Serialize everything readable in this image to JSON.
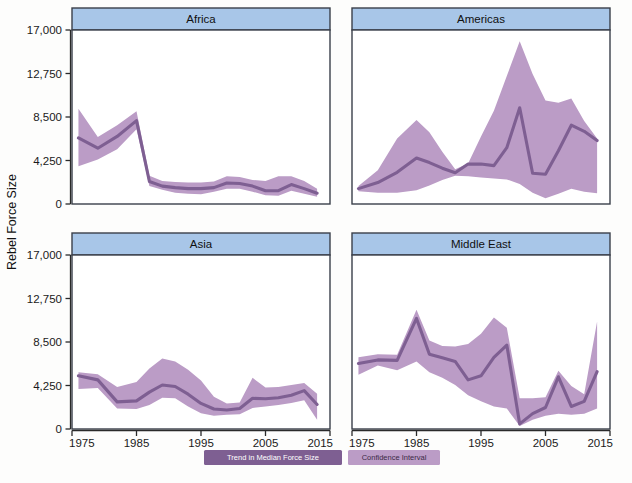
{
  "figure": {
    "ylabel": "Rebel Force Size",
    "panel_header_color": "#a8c6e8",
    "panel_border_color": "#3a3f4a",
    "band_color": "#bb9cc6",
    "line_color": "#7e5f92",
    "background": "#fdfdfc"
  },
  "legend": {
    "items": [
      {
        "label": "Trend in Median Force Size",
        "swatch": "#7e5f92",
        "text_color": "#ffffff"
      },
      {
        "label": "Confidence Interval",
        "swatch": "#bb9cc6",
        "text_color": "#3b2a46"
      }
    ]
  },
  "chart_data": {
    "type": "line",
    "title": "",
    "subtitle": "",
    "xlabel": "",
    "ylabel": "Rebel Force Size",
    "xlim": [
      1975,
      2015
    ],
    "ylim": [
      0,
      17000
    ],
    "xticks": [
      1975,
      1985,
      1995,
      2005,
      2015
    ],
    "xticklabels": [
      "1975",
      "1985",
      "1995",
      "2005",
      "2015"
    ],
    "yticks": [
      0,
      4250,
      8500,
      12750,
      17000
    ],
    "yticklabels": [
      "0",
      "4,250",
      "8,500",
      "12,750",
      "17,000"
    ],
    "grid": false,
    "legend_position": "bottom",
    "facet_layout": [
      [
        "Africa",
        "Americas"
      ],
      [
        "Asia",
        "Middle East"
      ]
    ],
    "band_label": "Confidence Interval",
    "line_label": "Trend in Median Force Size",
    "panels": [
      {
        "name": "Africa",
        "x": [
          1976,
          1979,
          1982,
          1985,
          1987,
          1989,
          1991,
          1993,
          1995,
          1997,
          1999,
          2001,
          2003,
          2005,
          2007,
          2009,
          2011,
          2013
        ],
        "median": [
          6450,
          5450,
          6600,
          8150,
          2200,
          1750,
          1600,
          1500,
          1500,
          1600,
          2050,
          2000,
          1750,
          1300,
          1300,
          1900,
          1500,
          1050
        ],
        "lower": [
          3700,
          4350,
          5350,
          7300,
          1750,
          1400,
          1100,
          1000,
          950,
          1200,
          1500,
          1500,
          1200,
          850,
          800,
          1300,
          1000,
          700
        ],
        "upper": [
          9300,
          6550,
          7700,
          9050,
          2750,
          2250,
          2150,
          2100,
          2100,
          2200,
          2700,
          2650,
          2350,
          2250,
          2700,
          2700,
          2250,
          1500
        ]
      },
      {
        "name": "Americas",
        "x": [
          1976,
          1979,
          1982,
          1985,
          1987,
          1989,
          1991,
          1993,
          1995,
          1997,
          1999,
          2001,
          2003,
          2005,
          2007,
          2009,
          2011,
          2013
        ],
        "median": [
          1500,
          2100,
          3100,
          4500,
          4050,
          3500,
          3050,
          3900,
          3900,
          3750,
          5500,
          9400,
          3000,
          2900,
          5200,
          7700,
          7100,
          6200
        ],
        "lower": [
          1250,
          1100,
          1100,
          1350,
          1800,
          2350,
          2750,
          2700,
          2600,
          2500,
          2400,
          1950,
          1100,
          550,
          1000,
          1500,
          1200,
          1050
        ],
        "upper": [
          1750,
          3300,
          6400,
          8200,
          7000,
          5100,
          3400,
          3950,
          6600,
          9100,
          12500,
          15900,
          12700,
          10100,
          9900,
          10300,
          8100,
          6400
        ]
      },
      {
        "name": "Asia",
        "x": [
          1976,
          1979,
          1982,
          1985,
          1987,
          1989,
          1991,
          1993,
          1995,
          1997,
          1999,
          2001,
          2003,
          2005,
          2007,
          2009,
          2011,
          2013
        ],
        "median": [
          5200,
          4800,
          2650,
          2750,
          3600,
          4300,
          4150,
          3400,
          2500,
          1950,
          1850,
          2000,
          3000,
          2950,
          3050,
          3300,
          3750,
          2400
        ],
        "lower": [
          3900,
          4000,
          2000,
          1950,
          2350,
          3050,
          3000,
          2200,
          1550,
          1300,
          1400,
          1450,
          2050,
          2200,
          2350,
          2550,
          2800,
          900
        ],
        "upper": [
          5550,
          5350,
          4100,
          4600,
          5900,
          6900,
          6600,
          5800,
          4750,
          3150,
          2500,
          2600,
          5000,
          4050,
          4100,
          4300,
          4500,
          3450
        ]
      },
      {
        "name": "Middle East",
        "x": [
          1976,
          1979,
          1982,
          1985,
          1987,
          1989,
          1991,
          1993,
          1995,
          1997,
          1999,
          2001,
          2003,
          2005,
          2007,
          2009,
          2011,
          2013
        ],
        "median": [
          6400,
          6750,
          6700,
          10800,
          7300,
          6950,
          6600,
          4800,
          5200,
          7000,
          8200,
          500,
          1500,
          2100,
          5100,
          2200,
          2700,
          5600
        ],
        "lower": [
          5300,
          6200,
          5750,
          6600,
          5550,
          5000,
          4300,
          3300,
          2700,
          2200,
          2000,
          300,
          900,
          1300,
          1500,
          1400,
          1500,
          2000
        ],
        "upper": [
          7000,
          7300,
          7250,
          11650,
          8650,
          8100,
          8050,
          8300,
          9300,
          10900,
          9900,
          3000,
          3000,
          3100,
          5700,
          4200,
          3400,
          10500
        ]
      }
    ]
  }
}
